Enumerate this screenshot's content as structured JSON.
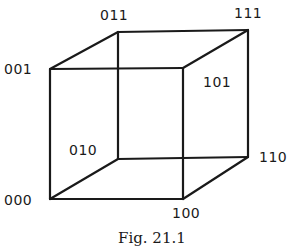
{
  "figure": {
    "type": "cube",
    "caption": "Fig. 21.1",
    "vertices": [
      {
        "id": "000",
        "label": "000",
        "x": 50,
        "y": 199
      },
      {
        "id": "001",
        "label": "001",
        "x": 50,
        "y": 69
      },
      {
        "id": "010",
        "label": "010",
        "x": 118,
        "y": 159
      },
      {
        "id": "011",
        "label": "011",
        "x": 118,
        "y": 32
      },
      {
        "id": "100",
        "label": "100",
        "x": 183,
        "y": 199
      },
      {
        "id": "101",
        "label": "101",
        "x": 183,
        "y": 68
      },
      {
        "id": "110",
        "label": "110",
        "x": 248,
        "y": 157
      },
      {
        "id": "111",
        "label": "111",
        "x": 248,
        "y": 30
      }
    ],
    "edges": [
      [
        "000",
        "001"
      ],
      [
        "000",
        "100"
      ],
      [
        "000",
        "010"
      ],
      [
        "001",
        "101"
      ],
      [
        "001",
        "011"
      ],
      [
        "010",
        "011"
      ],
      [
        "010",
        "110"
      ],
      [
        "011",
        "111"
      ],
      [
        "100",
        "101"
      ],
      [
        "100",
        "110"
      ],
      [
        "101",
        "111"
      ],
      [
        "110",
        "111"
      ]
    ],
    "labels": {
      "v000": "000",
      "v001": "001",
      "v010": "010",
      "v011": "011",
      "v100": "100",
      "v101": "101",
      "v110": "110",
      "v111": "111"
    },
    "colors": {
      "stroke": "#1a1a1a",
      "background": "#ffffff"
    }
  }
}
